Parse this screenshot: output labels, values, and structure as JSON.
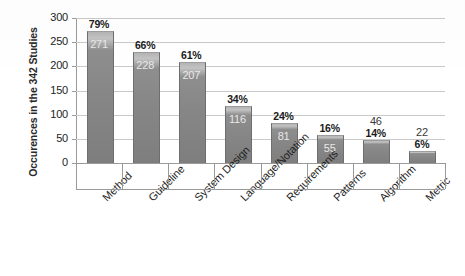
{
  "chart_data": {
    "type": "bar",
    "title": "",
    "xlabel": "",
    "ylabel": "Occurences in the 342 Studies",
    "ylim": [
      0,
      300
    ],
    "ytick_labels": [
      "300",
      "250",
      "200",
      "150",
      "100",
      "50",
      "0"
    ],
    "ytick_values": [
      300,
      250,
      200,
      150,
      100,
      50,
      0
    ],
    "grid": true,
    "legend": "none",
    "categories": [
      "Method",
      "Guideline",
      "System Design",
      "Language/Notation",
      "Requirements",
      "Patterns",
      "Algorithm",
      "Metric"
    ],
    "values": [
      271,
      228,
      207,
      116,
      81,
      55,
      46,
      22
    ],
    "value_labels": [
      "271",
      "228",
      "207",
      "116",
      "81",
      "55",
      "46",
      "22"
    ],
    "percent_labels": [
      "79%",
      "66%",
      "61%",
      "34%",
      "24%",
      "16%",
      "14%",
      "6%"
    ],
    "percent_values": [
      79,
      66,
      61,
      34,
      24,
      16,
      14,
      6
    ],
    "total_studies": 342,
    "colors": {
      "bar_fill": "#8b8b8b",
      "bar_edge": "#6e6e6e",
      "gridline": "#c9c9c9",
      "axis": "#9a9a9a",
      "text": "#1d1d1d",
      "background": "#ffffff",
      "value_label": "#e8e8e8",
      "percent_label": "#1a1a1a"
    }
  }
}
